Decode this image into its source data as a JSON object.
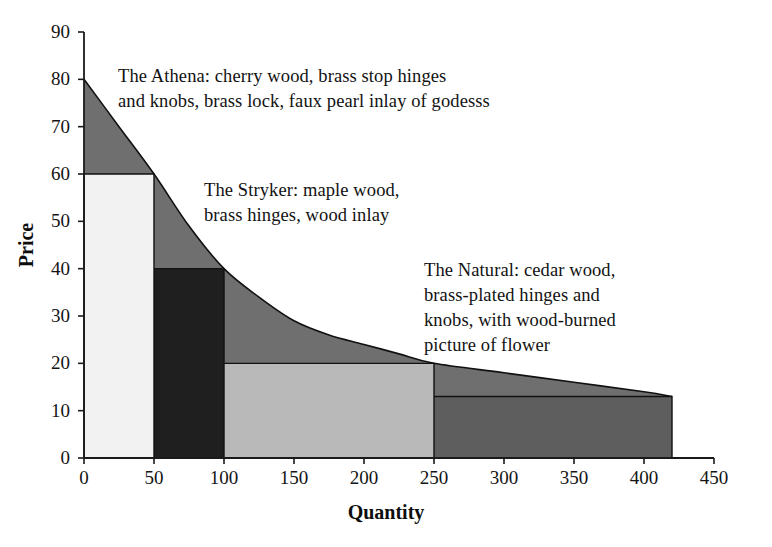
{
  "chart_data": {
    "type": "area",
    "title": "",
    "xlabel": "Quantity",
    "ylabel": "Price",
    "xlim": [
      0,
      450
    ],
    "ylim": [
      0,
      90
    ],
    "xticks": [
      0,
      50,
      100,
      150,
      200,
      250,
      300,
      350,
      400,
      450
    ],
    "yticks": [
      0,
      10,
      20,
      30,
      40,
      50,
      60,
      70,
      80,
      90
    ],
    "grid": false,
    "legend": "none",
    "curve_name": "demand curve",
    "curve_points": [
      {
        "x": 0,
        "y": 80
      },
      {
        "x": 25,
        "y": 70
      },
      {
        "x": 50,
        "y": 60
      },
      {
        "x": 75,
        "y": 49
      },
      {
        "x": 100,
        "y": 40
      },
      {
        "x": 125,
        "y": 34
      },
      {
        "x": 150,
        "y": 29
      },
      {
        "x": 175,
        "y": 26
      },
      {
        "x": 200,
        "y": 24
      },
      {
        "x": 225,
        "y": 22
      },
      {
        "x": 250,
        "y": 20
      },
      {
        "x": 300,
        "y": 18
      },
      {
        "x": 350,
        "y": 16
      },
      {
        "x": 400,
        "y": 14
      },
      {
        "x": 420,
        "y": 13
      }
    ],
    "segments": [
      {
        "name": "segment-1",
        "x_start": 0,
        "x_end": 50,
        "price": 60,
        "fill": "#f2f2f2"
      },
      {
        "name": "segment-2",
        "x_start": 50,
        "x_end": 100,
        "price": 40,
        "fill": "#1f1f1f"
      },
      {
        "name": "segment-3",
        "x_start": 100,
        "x_end": 250,
        "price": 20,
        "fill": "#b9b9b9"
      },
      {
        "name": "segment-4",
        "x_start": 250,
        "x_end": 420,
        "price": 13,
        "fill": "#5e5e5e"
      }
    ],
    "curve_area_fill": "#6f6f6f",
    "annotations": [
      {
        "name": "athena",
        "text": "The Athena: cherry wood, brass stop hinges\nand knobs, brass lock, faux pearl inlay of godesss"
      },
      {
        "name": "stryker",
        "text": "The Stryker: maple wood,\nbrass hinges, wood inlay"
      },
      {
        "name": "natural",
        "text": "The Natural: cedar wood,\nbrass-plated hinges and\nknobs, with wood-burned\npicture of flower"
      }
    ]
  },
  "axes": {
    "x_title": "Quantity",
    "y_title": "Price",
    "x_tick_labels": [
      "0",
      "50",
      "100",
      "150",
      "200",
      "250",
      "300",
      "350",
      "400",
      "450"
    ],
    "y_tick_labels": [
      "0",
      "10",
      "20",
      "30",
      "40",
      "50",
      "60",
      "70",
      "80",
      "90"
    ]
  },
  "labels": {
    "athena": "The Athena: cherry wood, brass stop hinges\nand knobs, brass lock, faux pearl inlay of godesss",
    "stryker": "The Stryker: maple wood,\nbrass hinges, wood inlay",
    "natural": "The Natural: cedar wood,\nbrass-plated hinges and\nknobs, with wood-burned\npicture of flower"
  },
  "colors": {
    "axis": "#1a1a1a",
    "segment_1": "#f2f2f2",
    "segment_2": "#1f1f1f",
    "segment_3": "#b9b9b9",
    "segment_4": "#5e5e5e",
    "curve_area": "#6f6f6f",
    "background": "#ffffff"
  }
}
